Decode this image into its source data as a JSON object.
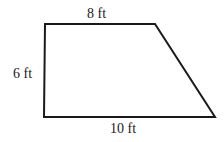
{
  "diagram": {
    "shape": "trapezoid",
    "labels": {
      "top": "8 ft",
      "left": "6 ft",
      "bottom": "10 ft"
    },
    "colors": {
      "stroke": "#1a1a1a",
      "background": "#ffffff"
    }
  }
}
